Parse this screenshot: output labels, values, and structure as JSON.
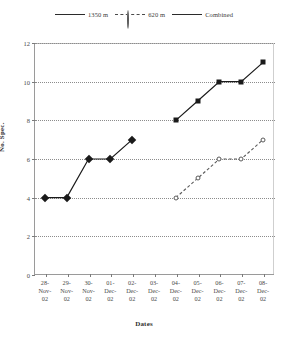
{
  "chart_data": {
    "type": "line",
    "title": "",
    "xlabel": "Dates",
    "ylabel": "No. Spec.",
    "ylim": [
      0,
      12
    ],
    "ytick_step": 2,
    "yticks": [
      "0",
      "2",
      "4",
      "6",
      "8",
      "10",
      "12"
    ],
    "grid": true,
    "legend_position": "top",
    "categories": [
      "28-Nov-02",
      "29-Nov-02",
      "30-Nov-02",
      "01-Dec-02",
      "02-Dec-02",
      "03-Dec-02",
      "04-Dec-02",
      "05-Dec-02",
      "06-Dec-02",
      "07-Dec-02",
      "08-Dec-02"
    ],
    "tick_labels": [
      {
        "day": "28-",
        "month": "Nov-",
        "year": "02"
      },
      {
        "day": "29-",
        "month": "Nov-",
        "year": "02"
      },
      {
        "day": "30-",
        "month": "Nov-",
        "year": "02"
      },
      {
        "day": "01-",
        "month": "Dec-",
        "year": "02"
      },
      {
        "day": "02-",
        "month": "Dec-",
        "year": "02"
      },
      {
        "day": "03-",
        "month": "Dec-",
        "year": "02"
      },
      {
        "day": "04-",
        "month": "Dec-",
        "year": "02"
      },
      {
        "day": "05-",
        "month": "Dec-",
        "year": "02"
      },
      {
        "day": "06-",
        "month": "Dec-",
        "year": "02"
      },
      {
        "day": "07-",
        "month": "Dec-",
        "year": "02"
      },
      {
        "day": "08-",
        "month": "Dec-",
        "year": "02"
      }
    ],
    "series": [
      {
        "name": "1350 m",
        "marker": "diamond",
        "line": "solid",
        "color": "#1a1a1a",
        "values": [
          4,
          4,
          6,
          6,
          7,
          null,
          null,
          null,
          null,
          null,
          null
        ]
      },
      {
        "name": "620 m",
        "marker": "circle",
        "line": "dashed",
        "color": "#5a5a5a",
        "values": [
          null,
          null,
          null,
          null,
          null,
          null,
          4,
          5,
          6,
          6,
          7
        ]
      },
      {
        "name": "Combined",
        "marker": "square",
        "line": "solid",
        "color": "#1a1a1a",
        "values": [
          null,
          null,
          null,
          null,
          null,
          null,
          8,
          9,
          10,
          10,
          11
        ]
      }
    ]
  },
  "legend": {
    "entries": [
      {
        "label": "1350 m"
      },
      {
        "label": "620 m"
      },
      {
        "label": "Combined"
      }
    ]
  },
  "axes": {
    "y_title": "No. Spec.",
    "x_title": "Dates"
  }
}
